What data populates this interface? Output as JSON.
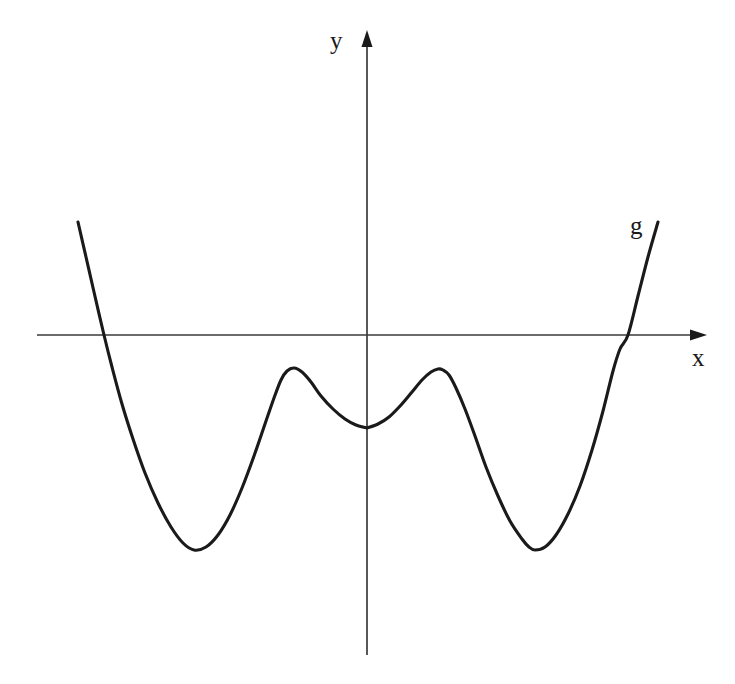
{
  "figure": {
    "background_color": "#ffffff",
    "width": 735,
    "height": 684,
    "curve_color": "#1a1a1a",
    "axis_color": "#3a3a3a"
  },
  "labels": {
    "y_axis": "y",
    "x_axis": "x",
    "curve": "g"
  },
  "chart_data": {
    "type": "line",
    "title": "",
    "subtitle": "",
    "xlabel": "x",
    "ylabel": "y",
    "series_name": "g",
    "grid": false,
    "legend": "none",
    "annotations": [
      "g"
    ],
    "axes": {
      "origin_px": [
        367,
        335
      ],
      "x_axis_px": {
        "start": 37,
        "end": 707,
        "y": 335,
        "arrow": "right"
      },
      "y_axis_px": {
        "top": 30,
        "bottom": 655,
        "x": 367,
        "arrow": "up"
      },
      "tick_labels_x": [],
      "tick_labels_y": [],
      "xlim": [
        -3.3,
        3.4
      ],
      "ylim": [
        -2.4,
        1.7
      ]
    },
    "features": {
      "cusp_at_origin_px": [
        367,
        428
      ],
      "local_maxima_px": [
        [
          287,
          371
        ],
        [
          443,
          370
        ]
      ],
      "local_minima_px": [
        [
          194,
          550
        ],
        [
          535,
          550
        ]
      ],
      "x_intercepts_px": [
        [
          104,
          335
        ],
        [
          628,
          335
        ]
      ],
      "endpoints_px": [
        [
          78,
          222
        ],
        [
          658,
          222
        ]
      ]
    },
    "points_px": [
      [
        78,
        222
      ],
      [
        86,
        257
      ],
      [
        94,
        292
      ],
      [
        104,
        335
      ],
      [
        112,
        367
      ],
      [
        122,
        404
      ],
      [
        133,
        439
      ],
      [
        145,
        473
      ],
      [
        158,
        503
      ],
      [
        171,
        527
      ],
      [
        183,
        543
      ],
      [
        194,
        550
      ],
      [
        206,
        547
      ],
      [
        218,
        535
      ],
      [
        230,
        515
      ],
      [
        242,
        488
      ],
      [
        254,
        456
      ],
      [
        265,
        424
      ],
      [
        274,
        398
      ],
      [
        281,
        380
      ],
      [
        287,
        371
      ],
      [
        294,
        368
      ],
      [
        302,
        372
      ],
      [
        311,
        382
      ],
      [
        321,
        396
      ],
      [
        333,
        409
      ],
      [
        345,
        419
      ],
      [
        356,
        425
      ],
      [
        367,
        428
      ],
      [
        378,
        424
      ],
      [
        389,
        417
      ],
      [
        401,
        405
      ],
      [
        412,
        392
      ],
      [
        422,
        380
      ],
      [
        431,
        372
      ],
      [
        438,
        369
      ],
      [
        443,
        370
      ],
      [
        449,
        375
      ],
      [
        456,
        388
      ],
      [
        465,
        409
      ],
      [
        475,
        436
      ],
      [
        486,
        467
      ],
      [
        498,
        496
      ],
      [
        510,
        521
      ],
      [
        522,
        539
      ],
      [
        529,
        547
      ],
      [
        535,
        550
      ],
      [
        545,
        547
      ],
      [
        556,
        535
      ],
      [
        568,
        514
      ],
      [
        580,
        486
      ],
      [
        592,
        450
      ],
      [
        603,
        411
      ],
      [
        613,
        371
      ],
      [
        620,
        349
      ],
      [
        628,
        335
      ],
      [
        638,
        296
      ],
      [
        648,
        257
      ],
      [
        658,
        222
      ]
    ],
    "normalized": {
      "note": "Curve in data units using origin (367,335) and approximate scale 100 px per unit on x and 95 px per unit on y.",
      "x": [
        -2.89,
        -2.63,
        -2.33,
        -2.0,
        -1.73,
        -1.4,
        -1.1,
        -0.8,
        -0.5,
        -0.2,
        0.0,
        0.2,
        0.5,
        0.8,
        1.1,
        1.4,
        1.73,
        2.0,
        2.33,
        2.63,
        2.89
      ],
      "y": [
        1.19,
        0.45,
        0.0,
        -0.73,
        -1.3,
        -2.05,
        -2.26,
        -1.93,
        -1.26,
        -0.75,
        -0.98,
        -0.75,
        -1.26,
        -1.93,
        -2.26,
        -2.05,
        -1.3,
        -0.73,
        0.0,
        0.45,
        1.19
      ]
    }
  }
}
